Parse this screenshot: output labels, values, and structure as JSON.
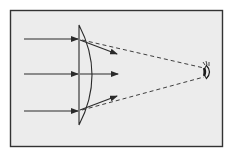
{
  "diagram": {
    "title": "Diverging lens with eye viewing virtual image",
    "colors": {
      "background": "#ffffff",
      "panel": "#ececec",
      "frame": "#333333",
      "lines": "#2a2a2a"
    },
    "frame": {
      "x": 10,
      "y": 10,
      "w": 213,
      "h": 137
    },
    "lens": {
      "type": "plano-concave diverging lens",
      "flat_x": 79,
      "top_y": 25,
      "bottom_y": 125,
      "bulge_x": 97
    },
    "incoming_rays": [
      {
        "y": 39,
        "x_start": 24,
        "x_end": 78
      },
      {
        "y": 74,
        "x_start": 24,
        "x_end": 78
      },
      {
        "y": 111,
        "x_start": 24,
        "x_end": 78
      }
    ],
    "outgoing_rays": [
      {
        "from": [
          80,
          40
        ],
        "to": [
          117,
          54
        ]
      },
      {
        "from": [
          80,
          74
        ],
        "to": [
          118,
          74
        ]
      },
      {
        "from": [
          80,
          110
        ],
        "to": [
          117,
          96
        ]
      }
    ],
    "dashed_lines": [
      {
        "from": [
          80,
          40
        ],
        "to": [
          205,
          68
        ]
      },
      {
        "from": [
          80,
          110
        ],
        "to": [
          205,
          77
        ]
      }
    ],
    "eye": {
      "icon": "eye-icon",
      "x": 208,
      "y": 72
    }
  }
}
